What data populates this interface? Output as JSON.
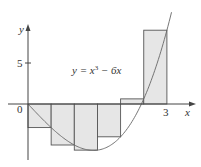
{
  "chart_data": {
    "type": "bar",
    "subtype": "riemann-sum-right-endpoints",
    "title": "",
    "function_label": "y = x³ − 6x",
    "xlabel": "x",
    "ylabel": "y",
    "x_ticks": [
      {
        "value": 0,
        "label": "0"
      },
      {
        "value": 3,
        "label": "3"
      }
    ],
    "y_ticks": [
      {
        "value": 5,
        "label": "5"
      }
    ],
    "xlim": [
      -0.5,
      3.7
    ],
    "ylim": [
      -7,
      12
    ],
    "grid": false,
    "n": 6,
    "interval": [
      0,
      3
    ],
    "categories": [
      "[0,0.5]",
      "[0.5,1]",
      "[1,1.5]",
      "[1.5,2]",
      "[2,2.5]",
      "[2.5,3]"
    ],
    "x_left": [
      0,
      0.5,
      1,
      1.5,
      2,
      2.5
    ],
    "width": 0.5,
    "values": [
      -2.875,
      -5,
      -5.625,
      -4,
      0.625,
      9
    ],
    "curve": {
      "expr": "x^3 - 6x",
      "x_range": [
        0,
        3.1
      ]
    },
    "colors": {
      "fill": "#e6e6e6",
      "stroke": "#555555",
      "curve": "#666666",
      "axis": "#444444"
    }
  },
  "labels": {
    "y_axis": "y",
    "x_axis": "x",
    "tick_zero": "0",
    "tick_three": "3",
    "tick_five": "5",
    "equation_prefix": "y = x",
    "equation_exp": "3",
    "equation_suffix": " − 6x"
  }
}
